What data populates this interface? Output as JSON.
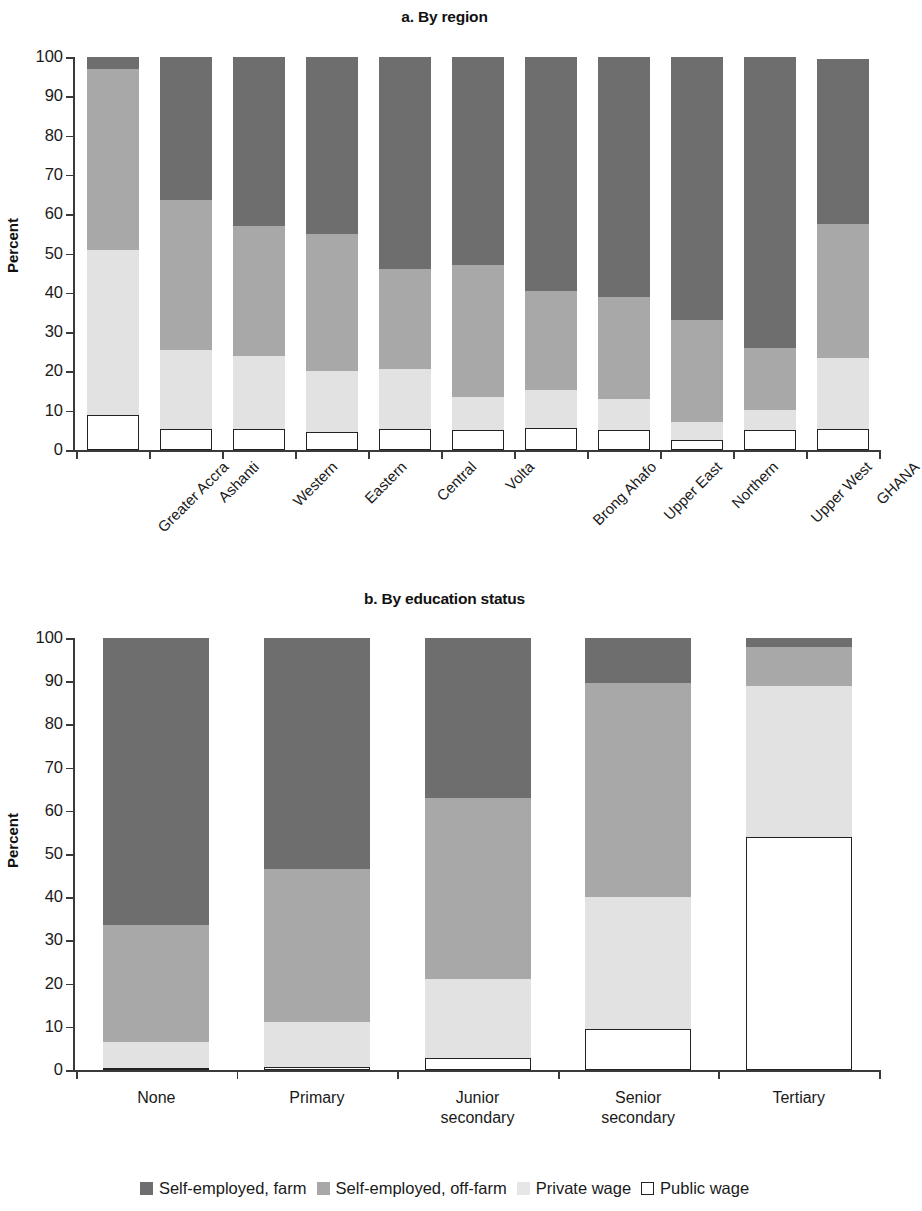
{
  "figure": {
    "ylabel": "Percent",
    "legend": [
      {
        "key": "farm",
        "label": "Self-employed, farm",
        "color": "#6e6e6e"
      },
      {
        "key": "offfarm",
        "label": "Self-employed, off-farm",
        "color": "#a8a8a8"
      },
      {
        "key": "private",
        "label": "Private wage",
        "color": "#e6e6e6"
      },
      {
        "key": "public",
        "label": "Public wage",
        "color": "#ffffff"
      }
    ]
  },
  "chart_data": [
    {
      "type": "bar",
      "stacked": true,
      "title": "a. By region",
      "xlabel": "",
      "ylabel": "Percent",
      "ylim": [
        0,
        100
      ],
      "yticks": [
        0,
        10,
        20,
        30,
        40,
        50,
        60,
        70,
        80,
        90,
        100
      ],
      "ytick_labels": [
        "0",
        "10",
        "20",
        "30",
        "40",
        "50",
        "60",
        "70",
        "80",
        "90",
        "100"
      ],
      "grid": false,
      "legend_position": "bottom-shared",
      "categories": [
        "Greater Accra",
        "Ashanti",
        "Western",
        "Eastern",
        "Central",
        "Volta",
        "Brong Ahafo",
        "Upper East",
        "Northern",
        "Upper West",
        "GHANA"
      ],
      "series": [
        {
          "name": "Public wage",
          "color": "#ffffff",
          "values": [
            9.0,
            5.3,
            5.3,
            4.7,
            5.3,
            5.0,
            5.5,
            5.0,
            2.6,
            5.0,
            5.3
          ]
        },
        {
          "name": "Private wage",
          "color": "#e2e2e2",
          "values": [
            42.0,
            20.2,
            18.7,
            15.3,
            15.2,
            8.4,
            9.7,
            8.0,
            4.4,
            5.3,
            18.2
          ]
        },
        {
          "name": "Self-employed, off-farm",
          "color": "#a8a8a8",
          "values": [
            46.0,
            38.0,
            33.0,
            35.0,
            25.5,
            33.6,
            25.3,
            26.0,
            26.0,
            15.7,
            33.9
          ]
        },
        {
          "name": "Self-employed, farm",
          "color": "#6e6e6e",
          "values": [
            3.0,
            36.5,
            43.0,
            45.0,
            54.0,
            53.0,
            59.5,
            61.0,
            67.0,
            74.0,
            42.1
          ]
        }
      ],
      "stack_tops": {
        "Greater Accra": {
          "public": 9.0,
          "private": 51.0,
          "offfarm": 97.0,
          "farm": 100.0
        },
        "Ashanti": {
          "public": 5.3,
          "private": 25.5,
          "offfarm": 63.5,
          "farm": 100.0
        },
        "Western": {
          "public": 5.3,
          "private": 24.0,
          "offfarm": 57.0,
          "farm": 100.0
        },
        "Eastern": {
          "public": 4.7,
          "private": 20.0,
          "offfarm": 55.0,
          "farm": 100.0
        },
        "Central": {
          "public": 5.3,
          "private": 20.5,
          "offfarm": 46.0,
          "farm": 100.0
        },
        "Volta": {
          "public": 5.0,
          "private": 13.4,
          "offfarm": 47.0,
          "farm": 100.0
        },
        "Brong Ahafo": {
          "public": 5.5,
          "private": 15.2,
          "offfarm": 40.5,
          "farm": 100.0
        },
        "Upper East": {
          "public": 5.0,
          "private": 13.0,
          "offfarm": 39.0,
          "farm": 100.0
        },
        "Northern": {
          "public": 2.6,
          "private": 7.0,
          "offfarm": 33.0,
          "farm": 100.0
        },
        "Upper West": {
          "public": 5.0,
          "private": 10.3,
          "offfarm": 26.0,
          "farm": 100.0
        },
        "GHANA": {
          "public": 5.3,
          "private": 23.5,
          "offfarm": 57.4,
          "farm": 99.5
        }
      }
    },
    {
      "type": "bar",
      "stacked": true,
      "title": "b. By education status",
      "xlabel": "",
      "ylabel": "Percent",
      "ylim": [
        0,
        100
      ],
      "yticks": [
        0,
        10,
        20,
        30,
        40,
        50,
        60,
        70,
        80,
        90,
        100
      ],
      "ytick_labels": [
        "0",
        "10",
        "20",
        "30",
        "40",
        "50",
        "60",
        "70",
        "80",
        "90",
        "100"
      ],
      "grid": false,
      "legend_position": "bottom-shared",
      "categories": [
        "None",
        "Primary",
        "Junior secondary",
        "Senior secondary",
        "Tertiary"
      ],
      "series": [
        {
          "name": "Public wage",
          "color": "#ffffff",
          "values": [
            0.5,
            0.8,
            2.8,
            9.4,
            54.0
          ]
        },
        {
          "name": "Private wage",
          "color": "#e2e2e2",
          "values": [
            6.0,
            10.2,
            18.2,
            30.6,
            35.0
          ]
        },
        {
          "name": "Self-employed, off-farm",
          "color": "#a8a8a8",
          "values": [
            27.0,
            35.5,
            42.0,
            49.5,
            9.0
          ]
        },
        {
          "name": "Self-employed, farm",
          "color": "#6e6e6e",
          "values": [
            66.5,
            53.5,
            37.0,
            10.5,
            2.0
          ]
        }
      ],
      "stack_tops": {
        "None": {
          "public": 0.5,
          "private": 6.5,
          "offfarm": 33.5,
          "farm": 100.0
        },
        "Primary": {
          "public": 0.8,
          "private": 11.0,
          "offfarm": 46.5,
          "farm": 100.0
        },
        "Junior secondary": {
          "public": 2.8,
          "private": 21.0,
          "offfarm": 63.0,
          "farm": 100.0
        },
        "Senior secondary": {
          "public": 9.4,
          "private": 40.0,
          "offfarm": 89.5,
          "farm": 100.0
        },
        "Tertiary": {
          "public": 54.0,
          "private": 89.0,
          "offfarm": 98.0,
          "farm": 100.0
        }
      }
    }
  ]
}
